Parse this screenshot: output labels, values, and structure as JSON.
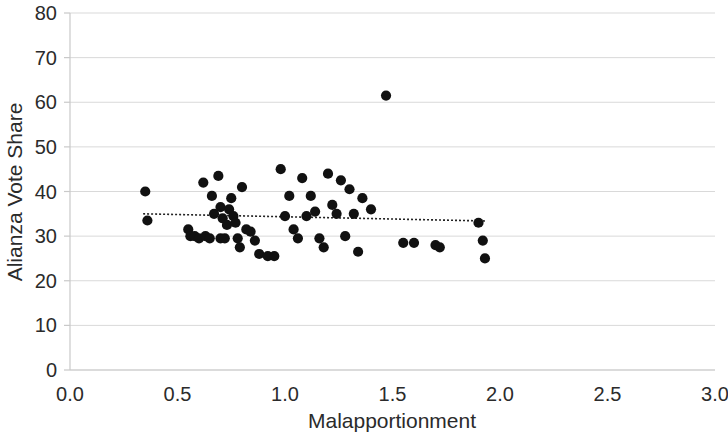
{
  "chart_data": {
    "type": "scatter",
    "title": "",
    "xlabel": "Malapportionment",
    "ylabel": "Alianza Vote Share",
    "xlim": [
      0.0,
      3.0
    ],
    "ylim": [
      0,
      80
    ],
    "x_ticks": [
      "0.0",
      "0.5",
      "1.0",
      "1.5",
      "2.0",
      "2.5",
      "3.0"
    ],
    "x_tick_values": [
      0.0,
      0.5,
      1.0,
      1.5,
      2.0,
      2.5,
      3.0
    ],
    "y_ticks": [
      "0",
      "10",
      "20",
      "30",
      "40",
      "50",
      "60",
      "70",
      "80"
    ],
    "y_tick_values": [
      0,
      10,
      20,
      30,
      40,
      50,
      60,
      70,
      80
    ],
    "grid": "horizontal",
    "legend": "none",
    "marker": {
      "shape": "circle",
      "color": "#111111",
      "size": 7
    },
    "series": [
      {
        "name": "Districts",
        "points": [
          [
            0.35,
            40.0
          ],
          [
            0.36,
            33.5
          ],
          [
            0.55,
            31.5
          ],
          [
            0.56,
            30.0
          ],
          [
            0.58,
            30.0
          ],
          [
            0.6,
            29.5
          ],
          [
            0.62,
            42.0
          ],
          [
            0.63,
            30.0
          ],
          [
            0.65,
            29.5
          ],
          [
            0.66,
            39.0
          ],
          [
            0.67,
            35.0
          ],
          [
            0.69,
            43.5
          ],
          [
            0.7,
            36.5
          ],
          [
            0.7,
            29.5
          ],
          [
            0.71,
            34.0
          ],
          [
            0.72,
            29.5
          ],
          [
            0.73,
            32.5
          ],
          [
            0.74,
            36.0
          ],
          [
            0.75,
            38.5
          ],
          [
            0.76,
            34.5
          ],
          [
            0.77,
            33.0
          ],
          [
            0.78,
            29.5
          ],
          [
            0.79,
            27.5
          ],
          [
            0.8,
            41.0
          ],
          [
            0.82,
            31.5
          ],
          [
            0.84,
            31.0
          ],
          [
            0.86,
            29.0
          ],
          [
            0.88,
            26.0
          ],
          [
            0.92,
            25.5
          ],
          [
            0.95,
            25.5
          ],
          [
            0.98,
            45.0
          ],
          [
            1.0,
            34.5
          ],
          [
            1.02,
            39.0
          ],
          [
            1.04,
            31.5
          ],
          [
            1.06,
            29.5
          ],
          [
            1.08,
            43.0
          ],
          [
            1.1,
            34.5
          ],
          [
            1.12,
            39.0
          ],
          [
            1.14,
            35.5
          ],
          [
            1.16,
            29.5
          ],
          [
            1.18,
            27.5
          ],
          [
            1.2,
            44.0
          ],
          [
            1.22,
            37.0
          ],
          [
            1.24,
            35.0
          ],
          [
            1.26,
            42.5
          ],
          [
            1.28,
            30.0
          ],
          [
            1.3,
            40.5
          ],
          [
            1.32,
            35.0
          ],
          [
            1.34,
            26.5
          ],
          [
            1.36,
            38.5
          ],
          [
            1.4,
            36.0
          ],
          [
            1.47,
            61.5
          ],
          [
            1.55,
            28.5
          ],
          [
            1.6,
            28.5
          ],
          [
            1.7,
            28.0
          ],
          [
            1.72,
            27.5
          ],
          [
            1.9,
            33.0
          ],
          [
            1.92,
            29.0
          ],
          [
            1.93,
            25.0
          ]
        ]
      }
    ],
    "trendline": {
      "type": "linear",
      "style": "dotted",
      "x_start": 0.34,
      "y_start": 35.0,
      "x_end": 1.93,
      "y_end": 33.4
    }
  }
}
